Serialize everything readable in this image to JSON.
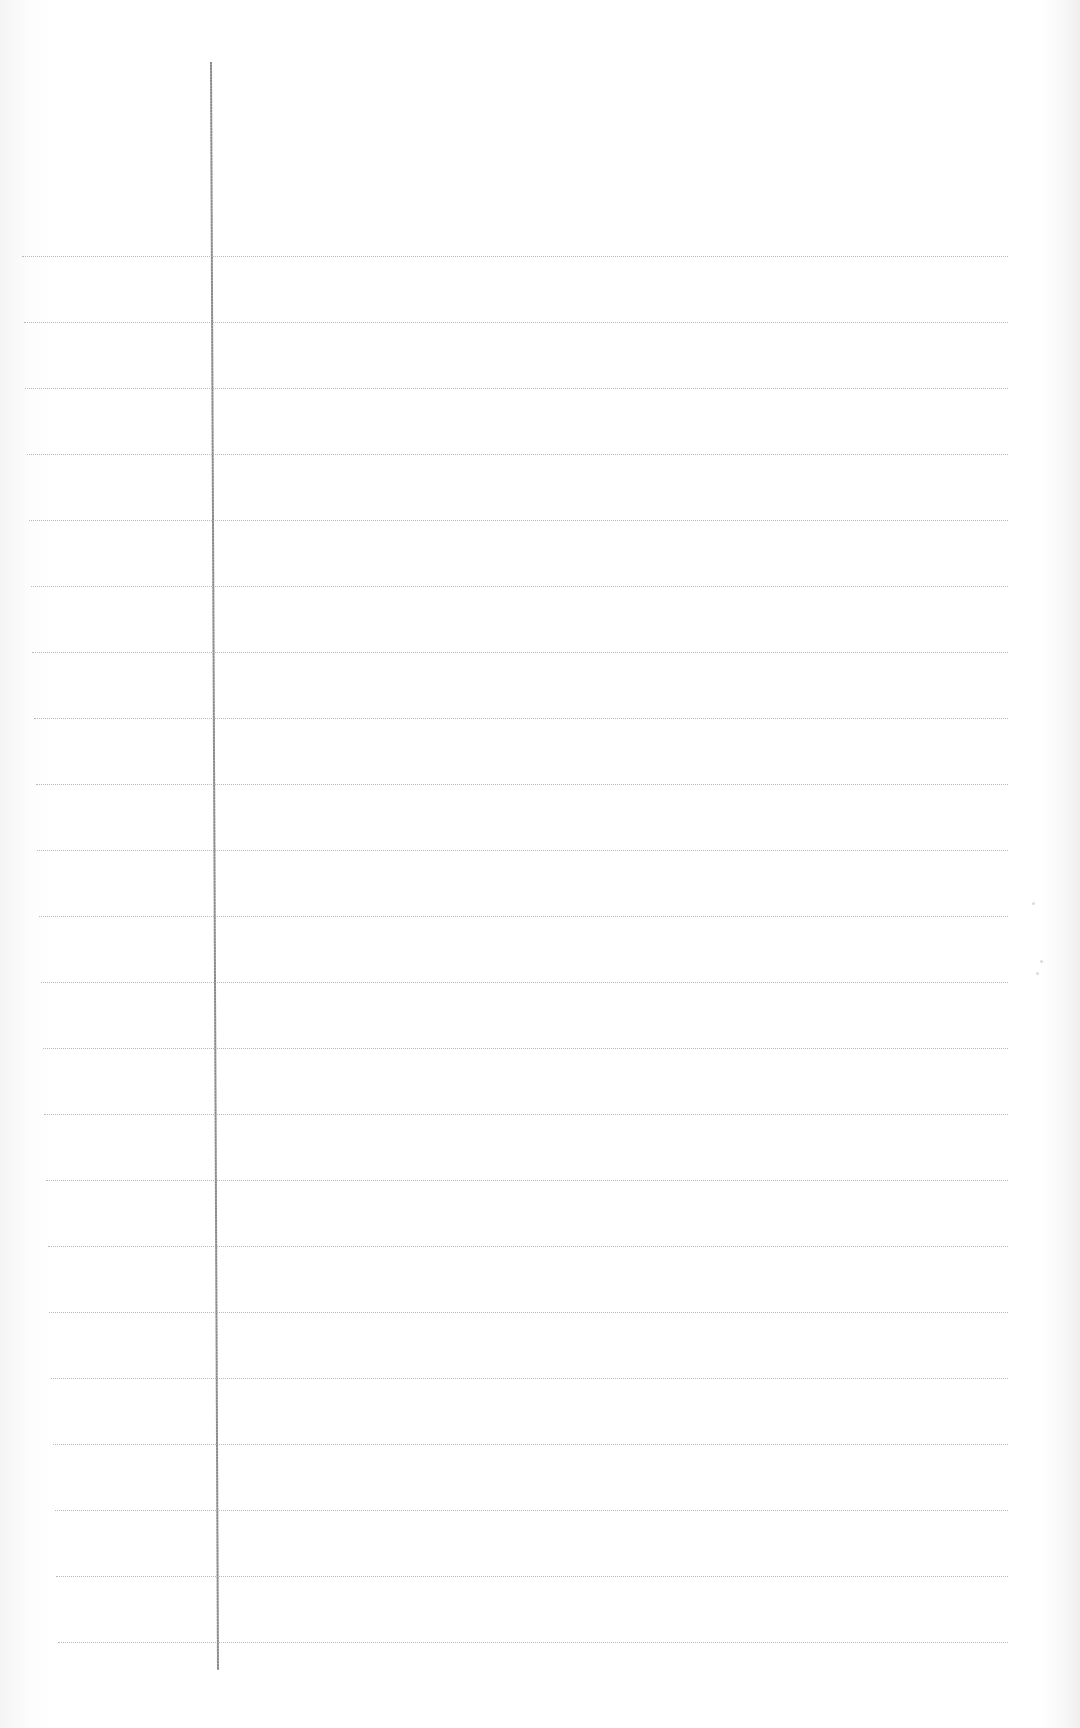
{
  "document": {
    "type": "ruled-notebook-page",
    "content": "",
    "background_color": "#ffffff",
    "rule_color": "#b9b9b9",
    "margin_line_color": "#8a8a8a",
    "rule_count": 22,
    "rule_spacing_px": 66,
    "first_rule_y": 256,
    "margin_line": {
      "x_top": 210,
      "x_bottom": 217,
      "y_top": 62,
      "y_bottom": 1670
    }
  }
}
